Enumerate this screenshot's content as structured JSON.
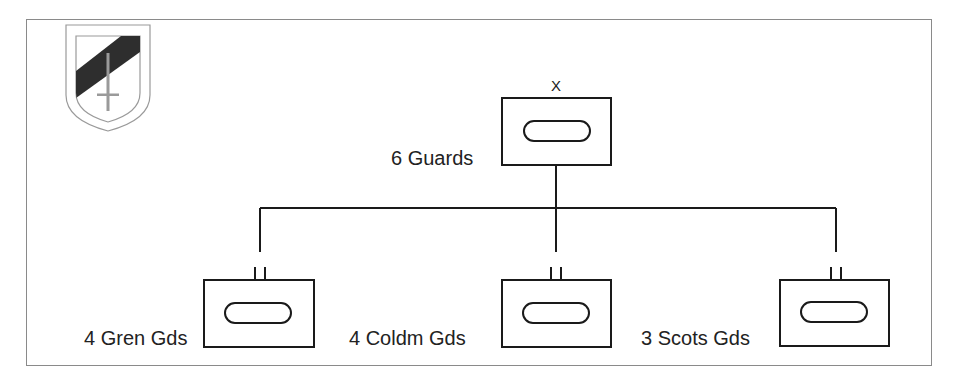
{
  "diagram": {
    "type": "military-order-of-battle",
    "insignia": {
      "name": "shield-insignia",
      "description": "shield with black diagonal band and sword"
    },
    "headquarters": {
      "label": "6 Guards",
      "echelon_marker": "X",
      "unit_symbol": "armoured"
    },
    "subordinates": [
      {
        "label": "4 Gren Gds",
        "echelon_marker": "II",
        "unit_symbol": "armoured"
      },
      {
        "label": "4 Coldm Gds",
        "echelon_marker": "II",
        "unit_symbol": "armoured"
      },
      {
        "label": "3 Scots Gds",
        "echelon_marker": "II",
        "unit_symbol": "armoured"
      }
    ],
    "colors": {
      "line": "#1a1a1a",
      "frame": "#8a8a8a",
      "band": "#2a2a2a"
    }
  }
}
